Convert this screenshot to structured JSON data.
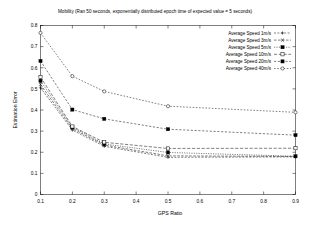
{
  "chart_data": {
    "type": "line",
    "title": "Mobility (Ran 50 seconds, exponentially distributed epoch time of expected value = 5 seconds)",
    "xlabel": "GPS Ratio",
    "ylabel": "Estimation Error",
    "xlim": [
      0.1,
      0.9
    ],
    "ylim": [
      0,
      0.8
    ],
    "xticks": [
      "0.1",
      "0.2",
      "0.3",
      "0.4",
      "0.5",
      "0.6",
      "0.7",
      "0.8",
      "0.9"
    ],
    "xtick_values": [
      0.1,
      0.2,
      0.3,
      0.4,
      0.5,
      0.6,
      0.7,
      0.8,
      0.9
    ],
    "yticks": [
      "0",
      "0.1",
      "0.2",
      "0.3",
      "0.4",
      "0.5",
      "0.6",
      "0.7",
      "0.8"
    ],
    "ytick_values": [
      0,
      0.1,
      0.2,
      0.3,
      0.4,
      0.5,
      0.6,
      0.7,
      0.8
    ],
    "grid": false,
    "legend_position": "top-right-inside",
    "x": [
      0.1,
      0.2,
      0.3,
      0.5,
      0.9
    ],
    "series": [
      {
        "name": "Average Speed 1m/s",
        "marker": "plus",
        "dash": "2,1.4",
        "values": [
          0.505,
          0.305,
          0.228,
          0.176,
          0.178
        ]
      },
      {
        "name": "Average Speed 3m/s",
        "marker": "cross",
        "dash": "2.6,1.4",
        "values": [
          0.52,
          0.312,
          0.234,
          0.183,
          0.18
        ]
      },
      {
        "name": "Average Speed 5m/s",
        "marker": "filled-square",
        "dash": "1.2,1.2",
        "values": [
          0.538,
          0.318,
          0.239,
          0.199,
          0.181
        ]
      },
      {
        "name": "Average Speed 10m/s",
        "marker": "open-square",
        "dash": "3.2,1.6",
        "values": [
          0.556,
          0.322,
          0.247,
          0.218,
          0.219
        ]
      },
      {
        "name": "Average Speed 20m/s",
        "marker": "filled-square",
        "dash": "2.2,1.6",
        "values": [
          0.632,
          0.402,
          0.358,
          0.309,
          0.281
        ]
      },
      {
        "name": "Average Speed 40m/s",
        "marker": "open-circle",
        "dash": "1.6,1.6",
        "values": [
          0.765,
          0.56,
          0.488,
          0.418,
          0.389
        ]
      }
    ]
  },
  "legend": {
    "items": [
      {
        "label": "Average Speed 1m/s"
      },
      {
        "label": "Average Speed 3m/s"
      },
      {
        "label": "Average Speed 5m/s"
      },
      {
        "label": "Average Speed 10m/s"
      },
      {
        "label": "Average Speed 20m/s"
      },
      {
        "label": "Average Speed 40m/s"
      }
    ]
  },
  "colors": {
    "background": "#ffffff",
    "foreground": "#000000",
    "axis": "#000000"
  }
}
